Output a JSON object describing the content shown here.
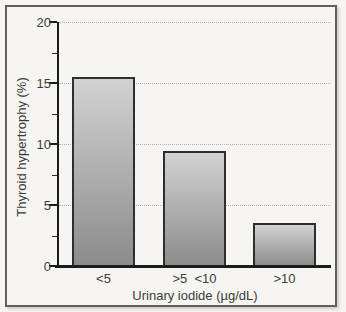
{
  "figure": {
    "background_color": "#f6f5f1",
    "frame_border_color": "#606060"
  },
  "chart_data": {
    "type": "bar",
    "title": "",
    "xlabel": "Urinary iodide (µg/dL)",
    "ylabel": "Thyroid hypertrophy (%)",
    "categories": [
      "<5",
      ">5  <10",
      ">10"
    ],
    "values": [
      15.5,
      9.4,
      3.5
    ],
    "ylim": [
      0,
      20
    ],
    "y_major_ticks": [
      0,
      5,
      10,
      15,
      20
    ],
    "y_minor_ticks": [
      2.5,
      7.5,
      12.5,
      17.5
    ],
    "grid": "horizontal dotted lines at major ticks",
    "legend": "none",
    "bar_fill_top_color": "#d2d2d2",
    "bar_fill_bottom_color": "#8b8b8b",
    "bar_border_color": "#2e2e2e",
    "axis_color": "#1c1c1c",
    "gridline_color": "#b5b5b5",
    "label_color": "#3b3b3b"
  }
}
